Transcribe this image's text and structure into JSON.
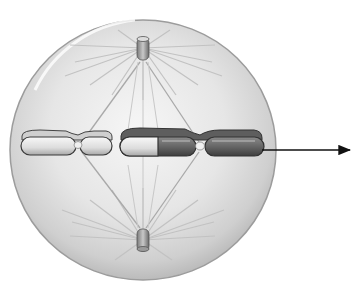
{
  "diagram": {
    "labels": [],
    "colors": {
      "background": "#ffffff",
      "cell_fill_center": "#f4f4f4",
      "cell_fill_edge": "#b8b8b8",
      "cell_outline": "#9a9a9a",
      "spindle_fiber": "#a8a8a8",
      "aster_ray": "#c4c4c4",
      "chromosome_light": "#e2e2e2",
      "chromosome_dark": "#5a5a5a",
      "chromosome_outline": "#3a3a3a",
      "centriole": "#8a8a8a",
      "arrow": "#111111"
    },
    "elements": {
      "cell": {
        "cx": 143,
        "cy": 149,
        "r": 133
      },
      "centriole_top": {
        "x": 143,
        "y": 50
      },
      "centriole_bottom": {
        "x": 143,
        "y": 240
      },
      "chromosomes": [
        {
          "id": "chromosome-left",
          "x1": 20,
          "x2": 112,
          "centromere_x": 78,
          "y": 146,
          "shade": "light"
        },
        {
          "id": "chromosome-right",
          "x1": 119,
          "x2": 265,
          "centromere_x": 201,
          "y": 146,
          "shade": "mixed"
        }
      ],
      "arrow": {
        "x1": 262,
        "y1": 150,
        "x2": 350,
        "y2": 150
      }
    }
  }
}
